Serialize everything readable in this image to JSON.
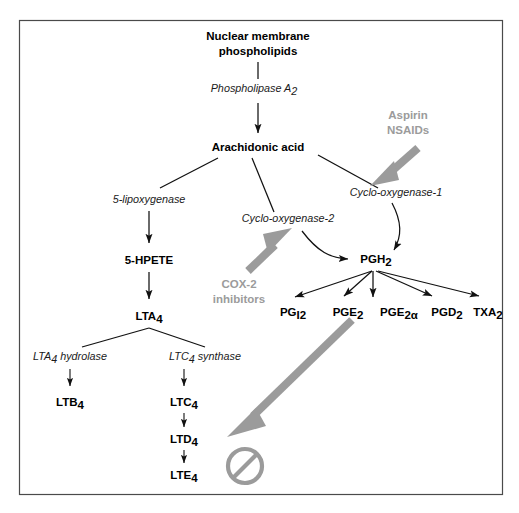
{
  "figure": {
    "background_color": "#ffffff",
    "frame_color": "#4a4a4a",
    "text_color": "#000000",
    "drug_color": "#9b9b9b",
    "arrow_color": "#111111"
  },
  "nodes": {
    "nuclear_membrane_line1": "Nuclear membrane",
    "nuclear_membrane_line2": "phospholipids",
    "arachidonic_acid": "Arachidonic acid",
    "hpete": "5-HPETE",
    "lta4_base": "LTA",
    "lta4_sub": "4",
    "ltb4_base": "LTB",
    "ltb4_sub": "4",
    "ltc4_base": "LTC",
    "ltc4_sub": "4",
    "ltd4_base": "LTD",
    "ltd4_sub": "4",
    "lte4_base": "LTE",
    "lte4_sub": "4",
    "pgh2_base": "PGH",
    "pgh2_sub": "2",
    "pgi2_base": "PG",
    "pgi2_sub": "I2",
    "pge2_base": "PGE",
    "pge2_sub": "2",
    "pge2a_base": "PGE",
    "pge2a_sub": "2α",
    "pgd2_base": "PGD",
    "pgd2_sub": "2",
    "txa2_base": "TXA",
    "txa2_sub": "2"
  },
  "enzymes": {
    "phospholipase_base": "Phospholipase A",
    "phospholipase_sub": "2",
    "lipoxygenase": "5-lipoxygenase",
    "cox1": "Cyclo-oxygenase-1",
    "cox2": "Cyclo-oxygenase-2",
    "lta4_hydrolase_base": "LTA",
    "lta4_hydrolase_sub": "4",
    "lta4_hydrolase_tail": " hydrolase",
    "ltc4_synthase_base": "LTC",
    "ltc4_synthase_sub": "4",
    "ltc4_synthase_tail": " synthase"
  },
  "drugs": {
    "aspirin_line1": "Aspirin",
    "aspirin_line2": "NSAIDs",
    "cox2_inhibitors_line1": "COX-2",
    "cox2_inhibitors_line2": "inhibitors"
  },
  "symbols": {
    "block_symbol": "no-entry-symbol"
  }
}
